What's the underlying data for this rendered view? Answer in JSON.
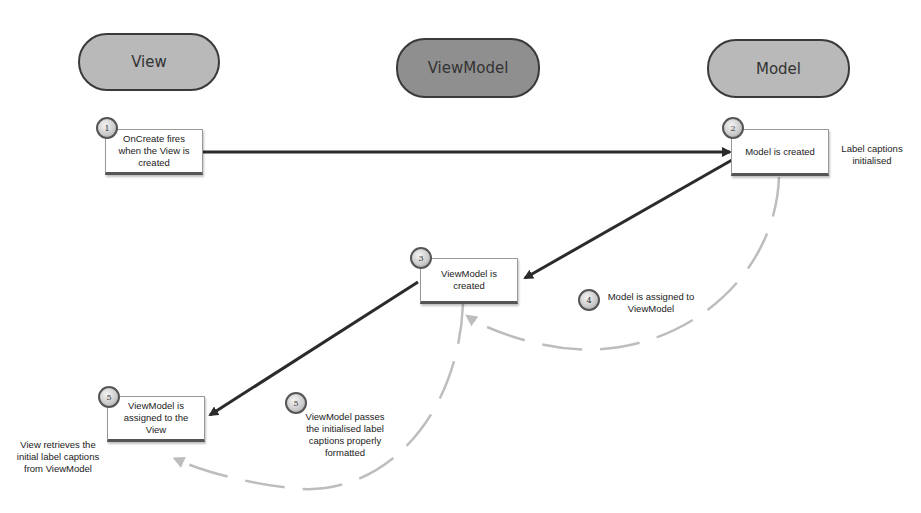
{
  "lanes": {
    "view": "View",
    "viewmodel": "ViewModel",
    "model": "Model"
  },
  "steps": [
    {
      "badge": "1",
      "text": "OnCreate fires when the View is created"
    },
    {
      "badge": "2",
      "text": "Model is created"
    },
    {
      "badge": "3",
      "text": "ViewModel is created"
    },
    {
      "badge": "4",
      "text": "Model is assigned to ViewModel"
    },
    {
      "badge": "5",
      "text": "ViewModel is assigned to the View"
    },
    {
      "badge": "5",
      "text": "ViewModel passes the initialised label captions properly formatted"
    }
  ],
  "notes": {
    "model_note": "Label captions initialised",
    "view_note": "View retrieves the initial label captions from ViewModel"
  },
  "colors": {
    "lane_light": "#b9b9b9",
    "lane_dark": "#8f8f8f",
    "solid_arrow": "#2b2b2b",
    "dashed_arrow": "#bdbdbd"
  }
}
